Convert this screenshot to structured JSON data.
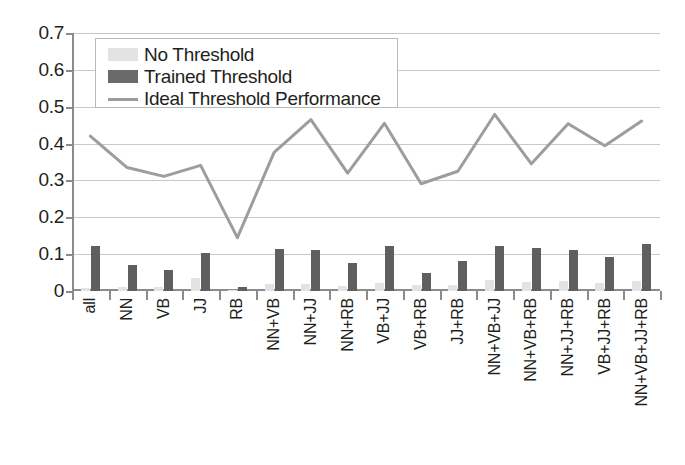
{
  "chart_data": {
    "type": "bar",
    "title": "",
    "xlabel": "",
    "ylabel": "",
    "ylim": [
      0,
      0.7
    ],
    "yticks": [
      "0",
      "0.1",
      "0.2",
      "0.3",
      "0.4",
      "0.5",
      "0.6",
      "0.7"
    ],
    "ytick_values": [
      0,
      0.1,
      0.2,
      0.3,
      0.4,
      0.5,
      0.6,
      0.7
    ],
    "grid": true,
    "legend_position": "upper-left",
    "categories": [
      "all",
      "NN",
      "VB",
      "JJ",
      "RB",
      "NN+VB",
      "NN+JJ",
      "NN+RB",
      "VB+JJ",
      "VB+RB",
      "JJ+RB",
      "NN+VB+JJ",
      "NN+VB+RB",
      "NN+JJ+RB",
      "VB+JJ+RB",
      "NN+VB+JJ+RB"
    ],
    "series": [
      {
        "name": "No Threshold",
        "render": "bar",
        "color": "#e3e3e3",
        "values": [
          0.008,
          0.012,
          0.01,
          0.035,
          0.002,
          0.018,
          0.02,
          0.014,
          0.021,
          0.016,
          0.015,
          0.03,
          0.024,
          0.026,
          0.022,
          0.028
        ]
      },
      {
        "name": "Trained Threshold",
        "render": "bar",
        "color": "#5f5f5f",
        "values": [
          0.122,
          0.071,
          0.058,
          0.102,
          0.012,
          0.115,
          0.11,
          0.077,
          0.122,
          0.05,
          0.081,
          0.123,
          0.116,
          0.112,
          0.093,
          0.128
        ]
      },
      {
        "name": "Ideal Threshold Performance",
        "render": "line",
        "color": "#9d9d9d",
        "values": [
          0.42,
          0.335,
          0.311,
          0.341,
          0.145,
          0.376,
          0.465,
          0.32,
          0.455,
          0.291,
          0.325,
          0.479,
          0.345,
          0.454,
          0.394,
          0.461
        ]
      }
    ]
  },
  "legend": {
    "items": [
      {
        "label": "No Threshold",
        "swatch": "light-square"
      },
      {
        "label": "Trained Threshold",
        "swatch": "dark-square"
      },
      {
        "label": "Ideal Threshold Performance",
        "swatch": "gray-line"
      }
    ]
  },
  "colors": {
    "no_threshold": "#e3e3e3",
    "trained_threshold": "#5f5f5f",
    "ideal_line": "#9d9d9d",
    "axis": "#8c8c8c",
    "grid": "#c9c9c9",
    "text": "#231f20"
  }
}
